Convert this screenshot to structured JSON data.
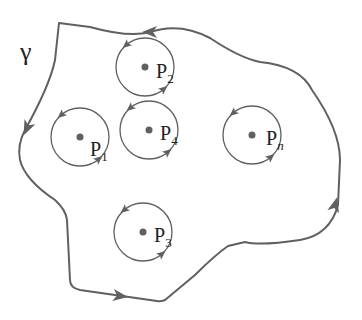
{
  "diagram": {
    "type": "contour-with-poles",
    "colors": {
      "stroke": "#606060",
      "dot": "#606060",
      "text": "#222222",
      "background": "#ffffff"
    },
    "contour": {
      "label": "γ",
      "label_position": [
        34,
        52
      ],
      "path": "M59,23 L90,27 Q130,38 150,32 Q180,22 210,38 Q240,58 260,62 Q300,66 312,90 Q340,130 340,160 L338,205 Q330,235 300,240 Q260,246 245,242 L228,246 Q215,255 195,275 L165,300 Q160,302 157,301 L80,290 Q70,288 70,280 L67,220 Q66,210 55,200 Q25,180 20,160 Q17,145 25,130 Q50,85 55,60 Z",
      "arrows": [
        {
          "x": 150,
          "y": 32,
          "angle": 180
        },
        {
          "x": 27,
          "y": 128,
          "angle": 115
        },
        {
          "x": 120,
          "y": 296,
          "angle": 8
        },
        {
          "x": 335,
          "y": 205,
          "angle": -75
        }
      ]
    },
    "poles": [
      {
        "name": "P",
        "sub": "1",
        "cx": 80,
        "cy": 137,
        "r": 29,
        "label_x": 90,
        "label_y": 156
      },
      {
        "name": "P",
        "sub": "2",
        "cx": 145,
        "cy": 67,
        "r": 29,
        "label_x": 156,
        "label_y": 78
      },
      {
        "name": "P",
        "sub": "4",
        "cx": 149,
        "cy": 130,
        "r": 29,
        "label_x": 160,
        "label_y": 140
      },
      {
        "name": "P",
        "sub": "3",
        "cx": 143,
        "cy": 232,
        "r": 29,
        "label_x": 154,
        "label_y": 242
      },
      {
        "name": "P",
        "sub": "n",
        "cx": 252,
        "cy": 135,
        "r": 29,
        "label_x": 266,
        "label_y": 145
      }
    ]
  }
}
